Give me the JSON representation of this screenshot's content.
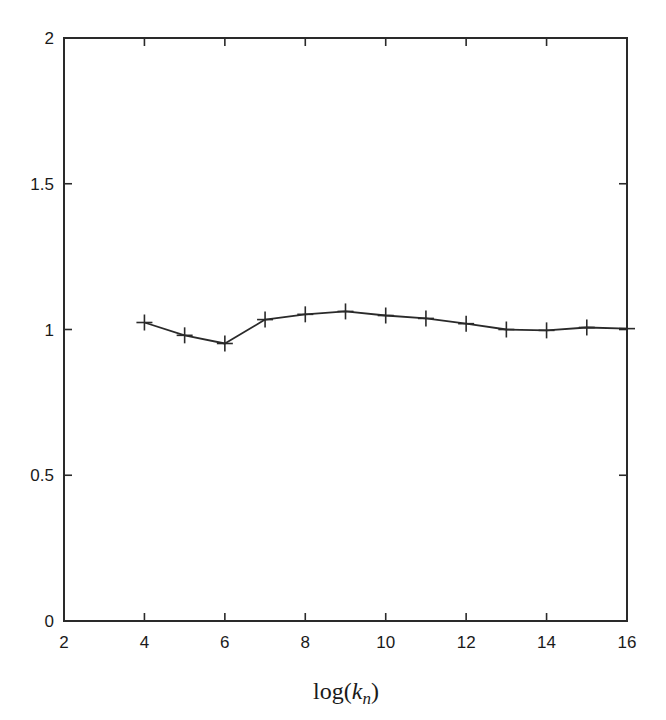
{
  "chart_data": {
    "type": "line",
    "title": "",
    "xlabel": "log(k_n)",
    "xlabel_parts": {
      "prefix": "log(",
      "var": "k",
      "sub": "n",
      "suffix": ")"
    },
    "ylabel": "",
    "xlim": [
      2,
      16
    ],
    "ylim": [
      0,
      2
    ],
    "xticks": [
      2,
      4,
      6,
      8,
      10,
      12,
      14,
      16
    ],
    "xtick_labels": [
      "2",
      "4",
      "6",
      "8",
      "10",
      "12",
      "14",
      "16"
    ],
    "yticks": [
      0,
      0.5,
      1,
      1.5,
      2
    ],
    "ytick_labels": [
      "0",
      "0.5",
      "1",
      "1.5",
      "2"
    ],
    "grid": false,
    "legend": null,
    "series": [
      {
        "name": "series-1",
        "marker": "plus",
        "color": "#2a2a2a",
        "x": [
          4,
          5,
          6,
          7,
          8,
          9,
          10,
          11,
          12,
          13,
          14,
          15,
          16
        ],
        "values": [
          1.024,
          0.98,
          0.952,
          1.034,
          1.052,
          1.062,
          1.048,
          1.038,
          1.02,
          1.0,
          0.997,
          1.007,
          1.003
        ]
      }
    ]
  }
}
